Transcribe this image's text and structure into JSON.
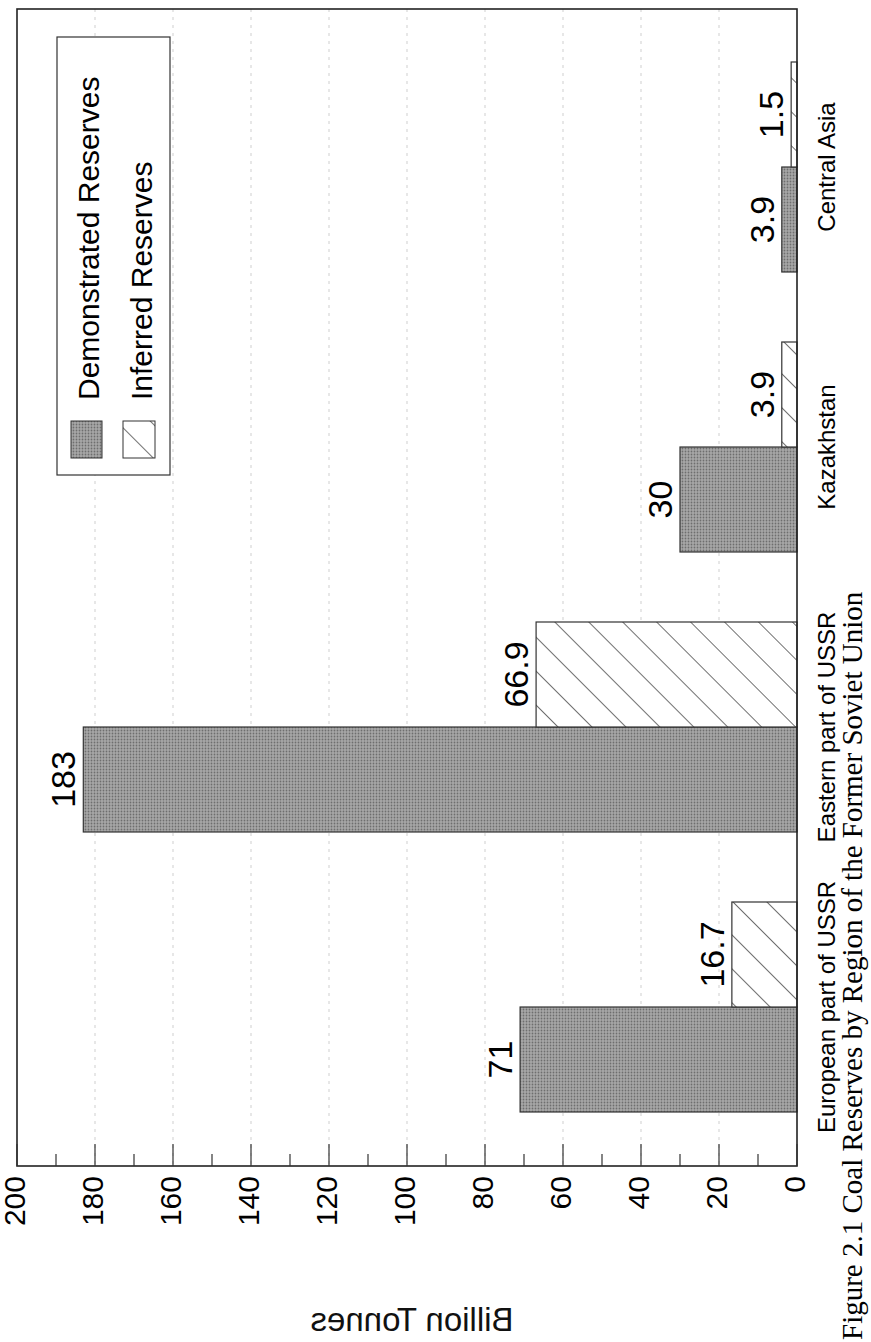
{
  "chart_data": {
    "type": "bar",
    "orientation": "rotated-page (horizontal bars printed sideways, value axis along bottom increasing right-to-left)",
    "title": "Figure 2.1 Coal Reserves by Region of the Former Soviet Union",
    "xlabel": "",
    "ylabel": "Billion Tonnes",
    "ylim": [
      0,
      200
    ],
    "yticks": [
      0,
      20,
      40,
      60,
      80,
      100,
      120,
      140,
      160,
      180,
      200
    ],
    "grid": true,
    "legend_position": "upper-left (rotated: top-right of chart)",
    "categories": [
      "European part of USSR",
      "Eastern part of USSR",
      "Kazakhstan",
      "Central Asia"
    ],
    "series": [
      {
        "name": "Demonstrated Reserves",
        "pattern": "stipple-gray",
        "color": "#9a9a9a",
        "values": [
          71,
          183,
          30,
          3.9
        ],
        "labels": [
          "71",
          "183",
          "30",
          "3.9"
        ]
      },
      {
        "name": "Inferred Reserves",
        "pattern": "diagonal-hatch",
        "color": "#ffffff",
        "values": [
          16.7,
          66.9,
          3.9,
          1.5
        ],
        "labels": [
          "16.7",
          "66.9",
          "3.9",
          "1.5"
        ]
      }
    ]
  },
  "caption": "Figure 2.1  Coal Reserves by Region of the Former Soviet Union",
  "colors": {
    "axis": "#222222",
    "grid": "#cfcfcf",
    "demonstrated": "#9a9a9a",
    "hatch": "#333333"
  }
}
